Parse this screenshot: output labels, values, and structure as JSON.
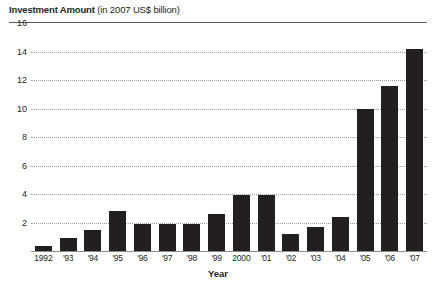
{
  "title": {
    "main": "Investment Amount",
    "sub": " (in 2007 US$ billion)"
  },
  "axis": {
    "x_title": "Year"
  },
  "chart_data": {
    "type": "bar",
    "title": "Investment Amount (in 2007 US$ billion)",
    "xlabel": "Year",
    "ylabel": "",
    "ylim": [
      0,
      16
    ],
    "yticks": [
      0,
      2,
      4,
      6,
      8,
      10,
      12,
      14,
      16
    ],
    "ytick_labels": [
      "",
      "2",
      "4",
      "6",
      "8",
      "10",
      "12",
      "14",
      "16"
    ],
    "grid": true,
    "legend": "none",
    "bar_color": "#231f20",
    "categories": [
      "1992",
      "'93",
      "'94",
      "'95",
      "'96",
      "'97",
      "'98",
      "'99",
      "2000",
      "'01",
      "'02",
      "'03",
      "'04",
      "'05",
      "'06",
      "'07"
    ],
    "values": [
      0.35,
      0.9,
      1.5,
      2.8,
      1.9,
      1.9,
      1.9,
      2.6,
      3.9,
      3.9,
      1.2,
      1.7,
      2.4,
      10.0,
      11.6,
      14.2
    ]
  }
}
